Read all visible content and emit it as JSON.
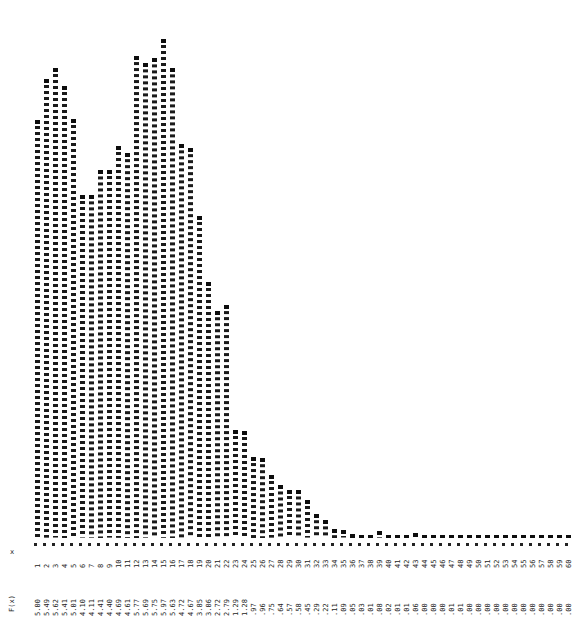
{
  "chart_data": {
    "type": "bar",
    "title": "",
    "subtitle": "",
    "xlabel": "x",
    "ylabel": "",
    "grid": false,
    "legend": null,
    "ylim": [
      0,
      6.2
    ],
    "xlim": [
      1,
      60
    ],
    "value_row_label": "F(x)",
    "categories": [
      "1",
      "2",
      "3",
      "4",
      "5",
      "6",
      "7",
      "8",
      "9",
      "10",
      "11",
      "12",
      "13",
      "14",
      "15",
      "16",
      "17",
      "18",
      "19",
      "20",
      "21",
      "22",
      "23",
      "24",
      "25",
      "26",
      "27",
      "28",
      "29",
      "30",
      "31",
      "32",
      "33",
      "34",
      "35",
      "36",
      "37",
      "38",
      "39",
      "40",
      "41",
      "42",
      "43",
      "44",
      "45",
      "46",
      "47",
      "48",
      "49",
      "50",
      "51",
      "52",
      "53",
      "54",
      "55",
      "56",
      "57",
      "58",
      "59",
      "60"
    ],
    "values": [
      5.0,
      5.49,
      5.62,
      5.41,
      5.01,
      4.1,
      4.11,
      4.41,
      4.4,
      4.69,
      4.61,
      5.77,
      5.69,
      5.75,
      5.97,
      5.63,
      4.72,
      4.67,
      3.85,
      3.06,
      2.72,
      2.79,
      1.29,
      1.28,
      0.97,
      0.96,
      0.75,
      0.64,
      0.57,
      0.58,
      0.45,
      0.29,
      0.22,
      0.11,
      0.09,
      0.05,
      0.03,
      0.01,
      0.08,
      0.02,
      0.01,
      0.01,
      0.06,
      0.0,
      0.0,
      0.0,
      0.01,
      0.01,
      0.0,
      0.0,
      0.0,
      0.0,
      0.0,
      0.0,
      0.0,
      0.0,
      0.0,
      0.0,
      0.0,
      0.0
    ],
    "value_labels": [
      "5.00",
      "5.49",
      "5.62",
      "5.41",
      "5.01",
      "4.10",
      "4.11",
      "4.41",
      "4.40",
      "4.69",
      "4.61",
      "5.77",
      "5.69",
      "5.75",
      "5.97",
      "5.63",
      "4.72",
      "4.67",
      "3.85",
      "3.06",
      "2.72",
      "2.79",
      "1.29",
      "1.28",
      ".97",
      ".96",
      ".75",
      ".64",
      ".57",
      ".58",
      ".45",
      ".29",
      ".22",
      ".11",
      ".09",
      ".05",
      ".03",
      ".01",
      ".08",
      ".02",
      ".01",
      ".01",
      ".06",
      ".00",
      ".00",
      ".00",
      ".01",
      ".01",
      ".00",
      ".00",
      ".00",
      ".00",
      ".00",
      ".00",
      ".00",
      ".00",
      ".00",
      ".00",
      ".00",
      ".00"
    ]
  }
}
